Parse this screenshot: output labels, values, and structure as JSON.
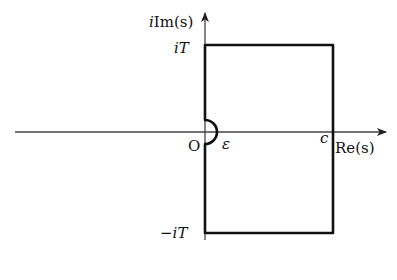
{
  "diagram": {
    "axes": {
      "vertical_label_prefix": "i",
      "vertical_label_fn": "Im",
      "vertical_label_arg": "(s)",
      "horizontal_label_fn": "Re",
      "horizontal_label_arg": "(s)"
    },
    "labels": {
      "top_prefix": "i",
      "top_var": "T",
      "bottom_prefix": "−i",
      "bottom_var": "T",
      "origin": "O",
      "epsilon": "ε",
      "c": "c"
    },
    "colors": {
      "contour": "#111111",
      "axis": "#333333"
    }
  }
}
